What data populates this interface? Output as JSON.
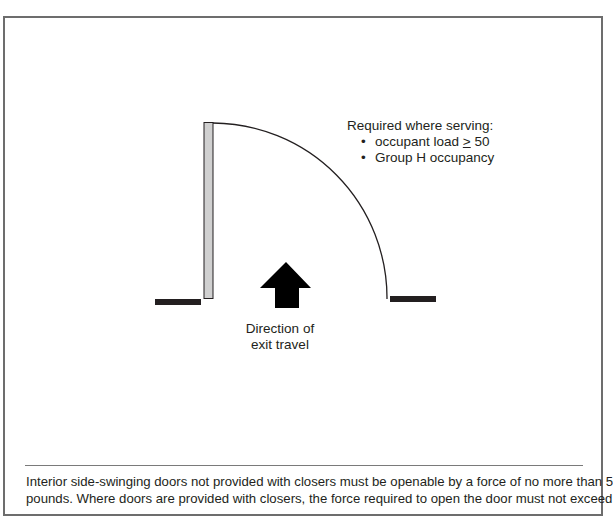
{
  "figure": {
    "requirements_note": {
      "heading": "Required where serving:",
      "items": [
        {
          "prefix": "occupant load ",
          "symbol": ">",
          "suffix": " 50"
        },
        {
          "prefix": "Group H occupancy",
          "symbol": "",
          "suffix": ""
        }
      ]
    },
    "arrow_caption": {
      "line1": "Direction of",
      "line2": "exit travel"
    },
    "elements": {
      "door_leaf": "door-leaf",
      "door_swing": "swing-arc",
      "direction_arrow": "up-arrow",
      "wall_left": "wall-segment",
      "wall_right": "wall-segment"
    },
    "colors": {
      "door_fill": "#d0d0d0",
      "wall": "#231f20",
      "frame_border": "#6d6d6d"
    }
  },
  "footnote": {
    "text": "Interior side-swinging doors not provided with closers must be openable by a force of no more than 5",
    "text_line2": "pounds. Where doors are provided with closers, the force required to open the door must not exceed"
  }
}
